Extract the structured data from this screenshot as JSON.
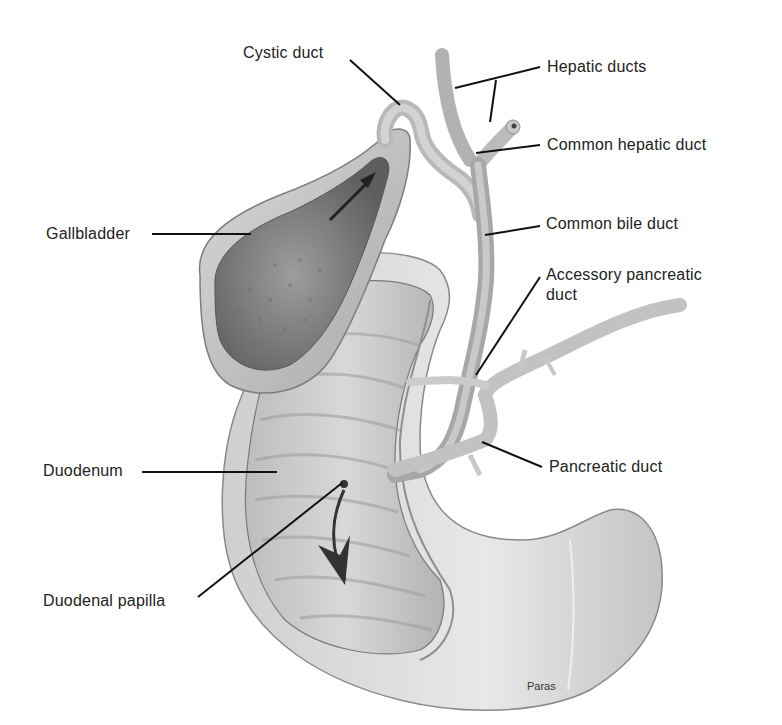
{
  "figure": {
    "labels": {
      "cystic_duct": "Cystic duct",
      "hepatic_ducts": "Hepatic ducts",
      "common_hepatic_duct": "Common hepatic duct",
      "gallbladder": "Gallbladder",
      "common_bile_duct": "Common bile duct",
      "accessory_pancreatic_duct_line1": "Accessory pancreatic",
      "accessory_pancreatic_duct_line2": "duct",
      "duodenum": "Duodenum",
      "pancreatic_duct": "Pancreatic duct",
      "duodenal_papilla": "Duodenal papilla"
    },
    "signature": "Paras"
  }
}
